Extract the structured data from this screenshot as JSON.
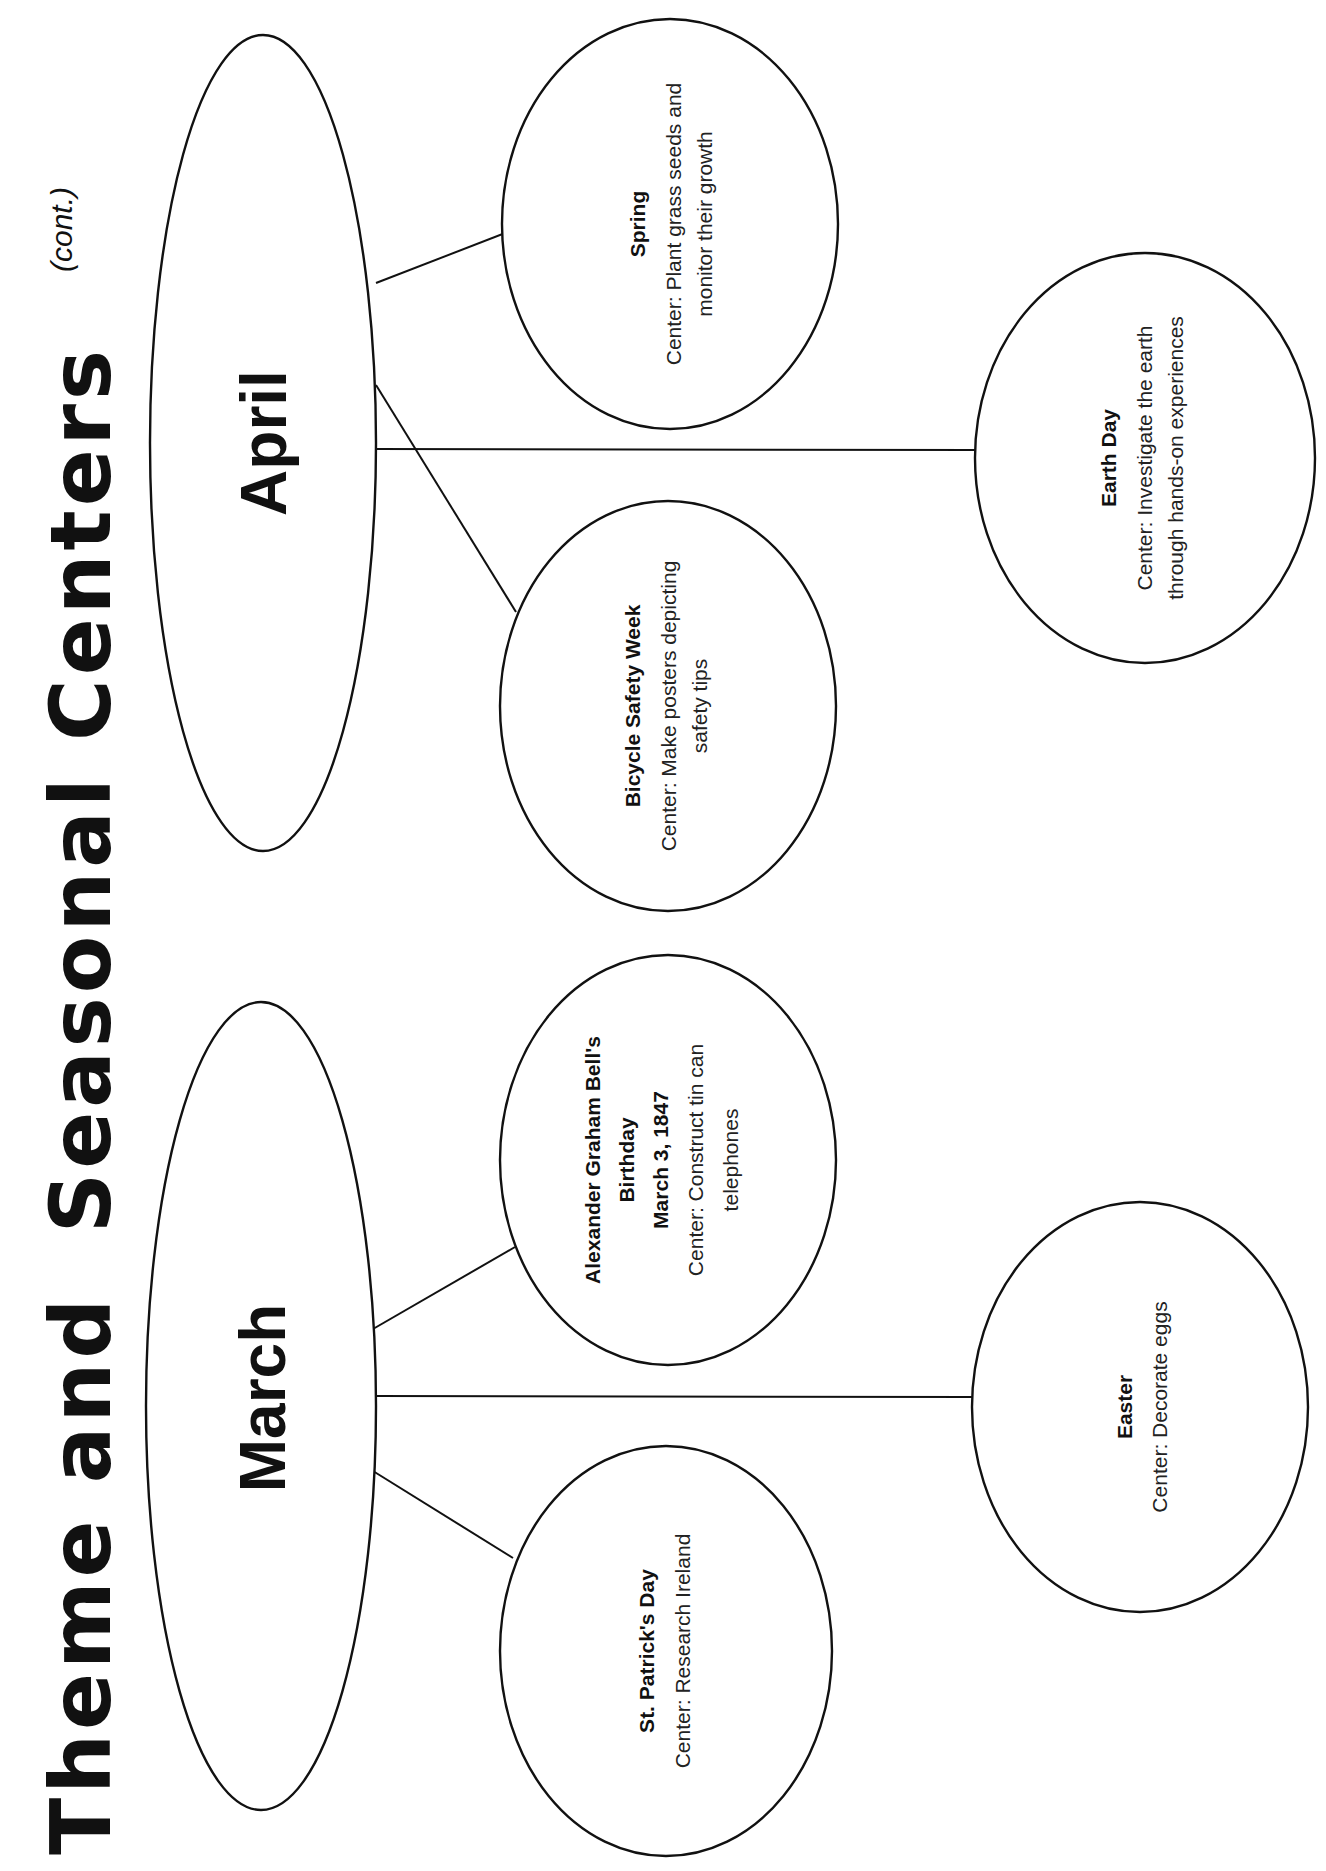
{
  "page": {
    "orientation": "rotated 90deg counter-clockwise (landscape page)",
    "title": {
      "main_part1": "Theme and",
      "main_part2": "Seasonal Centers",
      "suffix": "(cont.)"
    }
  },
  "months": [
    {
      "name": "April",
      "centers": [
        {
          "title": "Spring",
          "lines": [
            "Center: Plant grass seeds and",
            "monitor their growth"
          ]
        },
        {
          "title": "Earth Day",
          "lines": [
            "Center: Investigate the earth",
            "through hands-on experiences"
          ]
        },
        {
          "title": "Bicycle Safety Week",
          "lines": [
            "Center: Make posters depicting",
            "safety tips"
          ]
        }
      ]
    },
    {
      "name": "March",
      "centers": [
        {
          "title_lines": [
            "Alexander Graham Bell's",
            "Birthday",
            "March 3, 1847"
          ],
          "lines": [
            "Center: Construct tin can",
            "telephones"
          ]
        },
        {
          "title": "Easter",
          "lines": [
            "Center: Decorate eggs"
          ]
        },
        {
          "title": "St. Patrick's Day",
          "lines": [
            "Center: Research Ireland"
          ]
        }
      ]
    }
  ],
  "colors": {
    "ink": "#111111",
    "paper": "#ffffff"
  }
}
